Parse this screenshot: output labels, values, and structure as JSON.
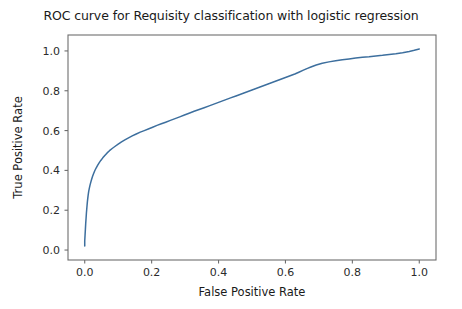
{
  "figure": {
    "title": "ROC curve for Requisity classification with logistic regression",
    "background_color": "#ffffff",
    "width": 462,
    "height": 309
  },
  "chart_data": {
    "type": "line",
    "title": "ROC curve for Requisity classification with logistic regression",
    "xlabel": "False Positive Rate",
    "ylabel": "True Positive Rate",
    "xlim": [
      -0.05,
      1.05
    ],
    "ylim": [
      -0.05,
      1.08
    ],
    "xticks": [
      0.0,
      0.2,
      0.4,
      0.6,
      0.8,
      1.0
    ],
    "yticks": [
      0.0,
      0.2,
      0.4,
      0.6,
      0.8,
      1.0
    ],
    "xtick_labels": [
      "0.0",
      "0.2",
      "0.4",
      "0.6",
      "0.8",
      "1.0"
    ],
    "ytick_labels": [
      "0.0",
      "0.2",
      "0.4",
      "0.6",
      "0.8",
      "1.0"
    ],
    "grid": false,
    "legend": null,
    "series": [
      {
        "name": "ROC curve",
        "color": "#3d6f9e",
        "linewidth": 1.5,
        "x": [
          0.0,
          0.0,
          0.001,
          0.002,
          0.003,
          0.004,
          0.005,
          0.006,
          0.007,
          0.008,
          0.009,
          0.01,
          0.011,
          0.012,
          0.014,
          0.016,
          0.018,
          0.02,
          0.023,
          0.026,
          0.03,
          0.034,
          0.038,
          0.043,
          0.048,
          0.054,
          0.06,
          0.067,
          0.074,
          0.082,
          0.09,
          0.1,
          0.11,
          0.12,
          0.131,
          0.142,
          0.154,
          0.166,
          0.178,
          0.19,
          0.203,
          0.216,
          0.229,
          0.242,
          0.256,
          0.27,
          0.284,
          0.298,
          0.312,
          0.327,
          0.342,
          0.357,
          0.372,
          0.388,
          0.404,
          0.42,
          0.436,
          0.452,
          0.468,
          0.484,
          0.5,
          0.516,
          0.532,
          0.548,
          0.564,
          0.58,
          0.596,
          0.612,
          0.628,
          0.64,
          0.652,
          0.664,
          0.676,
          0.692,
          0.71,
          0.73,
          0.75,
          0.77,
          0.79,
          0.81,
          0.83,
          0.85,
          0.87,
          0.89,
          0.91,
          0.93,
          0.95,
          0.97,
          0.985,
          1.0
        ],
        "y": [
          0.02,
          0.045,
          0.075,
          0.105,
          0.135,
          0.16,
          0.185,
          0.205,
          0.225,
          0.243,
          0.258,
          0.272,
          0.285,
          0.296,
          0.312,
          0.327,
          0.34,
          0.352,
          0.368,
          0.382,
          0.398,
          0.412,
          0.424,
          0.438,
          0.45,
          0.463,
          0.475,
          0.488,
          0.499,
          0.51,
          0.52,
          0.532,
          0.543,
          0.553,
          0.563,
          0.573,
          0.583,
          0.592,
          0.6,
          0.608,
          0.617,
          0.626,
          0.634,
          0.642,
          0.651,
          0.66,
          0.669,
          0.678,
          0.687,
          0.697,
          0.706,
          0.715,
          0.724,
          0.734,
          0.744,
          0.754,
          0.764,
          0.774,
          0.784,
          0.794,
          0.804,
          0.814,
          0.824,
          0.834,
          0.844,
          0.854,
          0.864,
          0.874,
          0.884,
          0.893,
          0.902,
          0.911,
          0.919,
          0.929,
          0.938,
          0.945,
          0.951,
          0.956,
          0.96,
          0.964,
          0.968,
          0.971,
          0.975,
          0.978,
          0.982,
          0.986,
          0.991,
          0.997,
          1.003,
          1.01
        ]
      }
    ]
  }
}
